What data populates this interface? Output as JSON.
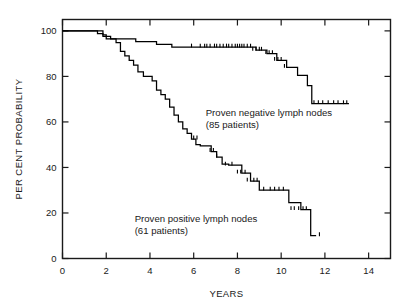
{
  "chart_data": {
    "type": "line",
    "title": "",
    "subtitle": "",
    "xlabel": "YEARS",
    "ylabel": "PER CENT PROBABILITY",
    "xlim": [
      0,
      15
    ],
    "ylim": [
      0,
      105
    ],
    "xticks": [
      0,
      2,
      4,
      6,
      8,
      10,
      12,
      14
    ],
    "xticklabels": [
      "0",
      "2",
      "4",
      "6",
      "8",
      "10",
      "12",
      "14"
    ],
    "yticks": [
      0,
      20,
      40,
      60,
      80,
      100
    ],
    "yticklabels": [
      "0",
      "20",
      "40",
      "60",
      "80",
      "100"
    ],
    "grid": false,
    "legend_position": "inside-annotations",
    "annotations": [
      {
        "name": "negative-nodes-label",
        "line1": "Proven negative lymph nodes",
        "line2": "(85 patients)",
        "x": 6.55,
        "y": 62.5
      },
      {
        "name": "positive-nodes-label",
        "line1": "Proven positive lymph nodes",
        "line2": "(61 patients)",
        "x": 3.3,
        "y": 16.0
      }
    ],
    "series": [
      {
        "name": "Proven negative lymph nodes",
        "patients": 85,
        "color": "#000000",
        "step": "post",
        "x": [
          0,
          1.55,
          1.6,
          1.75,
          1.85,
          2.05,
          2.2,
          2.55,
          3.2,
          3.35,
          3.75,
          4.3,
          4.55,
          5.0,
          5.15,
          8.6,
          8.85,
          9.15,
          9.35,
          9.6,
          9.8,
          10.05,
          10.25,
          10.5,
          10.75,
          10.95,
          11.2,
          11.4,
          13.1
        ],
        "y": [
          100,
          100,
          98.8,
          98.8,
          97.6,
          97.6,
          96.5,
          96.5,
          96.5,
          95.3,
          95.3,
          94.1,
          94.1,
          92.9,
          92.9,
          92.9,
          91.5,
          91.5,
          90.0,
          90.0,
          87.0,
          87.0,
          84.0,
          84.0,
          80.5,
          80.5,
          76.0,
          68.0,
          68.0
        ],
        "censored_x": [
          5.9,
          6.3,
          6.5,
          6.6,
          6.75,
          6.95,
          7.05,
          7.2,
          7.35,
          7.5,
          7.6,
          7.75,
          7.9,
          8.0,
          8.1,
          8.2,
          8.3,
          8.45,
          8.6,
          8.7,
          8.85,
          9.0,
          9.1,
          9.3,
          9.45,
          9.6,
          9.7,
          9.85,
          10.0,
          10.15,
          11.5,
          11.7,
          11.9,
          12.15,
          12.4,
          12.6,
          12.85,
          13.0
        ],
        "censored_y": [
          92.9,
          92.9,
          92.9,
          92.9,
          92.9,
          92.9,
          92.9,
          92.9,
          92.9,
          92.9,
          92.9,
          92.9,
          92.9,
          92.9,
          92.9,
          92.9,
          92.9,
          92.9,
          92.9,
          91.5,
          91.5,
          91.5,
          91.5,
          90.0,
          90.0,
          90.0,
          87.0,
          87.0,
          87.0,
          84.0,
          68.0,
          68.0,
          68.0,
          68.0,
          68.0,
          68.0,
          68.0,
          68.0
        ]
      },
      {
        "name": "Proven positive lymph nodes",
        "patients": 61,
        "color": "#000000",
        "step": "post",
        "x": [
          0,
          1.7,
          1.85,
          2.0,
          2.2,
          2.45,
          2.65,
          2.85,
          3.05,
          3.25,
          3.45,
          3.7,
          3.9,
          4.1,
          4.3,
          4.5,
          4.7,
          4.9,
          5.1,
          5.3,
          5.5,
          5.7,
          5.9,
          6.1,
          6.3,
          6.55,
          6.8,
          7.05,
          7.3,
          7.6,
          7.9,
          8.2,
          8.6,
          9.0,
          9.45,
          9.9,
          10.35,
          10.9,
          11.35,
          11.6
        ],
        "y": [
          100,
          100,
          98.3,
          96.5,
          96.5,
          94.8,
          91.0,
          89.0,
          87.0,
          85.0,
          82.0,
          80.0,
          80.0,
          78.0,
          74.0,
          72.0,
          70.0,
          66.5,
          63.0,
          60.0,
          57.0,
          55.0,
          52.5,
          50.0,
          49.5,
          49.5,
          47.0,
          44.5,
          41.5,
          41.0,
          41.0,
          37.5,
          34.0,
          30.0,
          30.0,
          30.0,
          24.5,
          21.5,
          10.0,
          10.0
        ],
        "censored_x": [
          6.0,
          6.15,
          6.75,
          6.9,
          7.05,
          7.45,
          7.75,
          8.0,
          8.15,
          8.35,
          8.45,
          8.75,
          8.9,
          9.2,
          9.5,
          9.7,
          9.9,
          10.1,
          10.45,
          10.6,
          10.8,
          11.0,
          11.15,
          11.75
        ],
        "censored_y": [
          52.5,
          52.5,
          47.0,
          47.0,
          44.5,
          41.0,
          41.0,
          37.5,
          37.5,
          37.5,
          34.0,
          34.0,
          34.0,
          30.0,
          30.0,
          30.0,
          30.0,
          30.0,
          21.5,
          21.5,
          21.5,
          21.5,
          21.5,
          10.0
        ]
      }
    ]
  }
}
